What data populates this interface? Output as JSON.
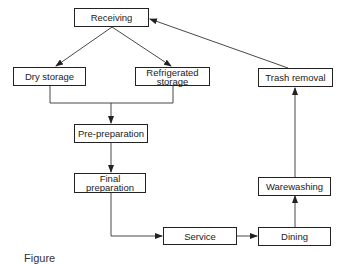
{
  "diagram": {
    "type": "flowchart",
    "nodes": {
      "receiving": "Receiving",
      "dry_storage": "Dry storage",
      "refrigerated_storage_line1": "Refrigerated",
      "refrigerated_storage_line2": "storage",
      "pre_preparation": "Pre-preparation",
      "final_preparation": "Final preparation",
      "service": "Service",
      "dining": "Dining",
      "warewashing": "Warewashing",
      "trash_removal": "Trash removal"
    },
    "edges": [
      {
        "from": "Receiving",
        "to": "Dry storage"
      },
      {
        "from": "Receiving",
        "to": "Refrigerated storage"
      },
      {
        "from": "Dry storage",
        "to": "Pre-preparation"
      },
      {
        "from": "Refrigerated storage",
        "to": "Pre-preparation"
      },
      {
        "from": "Pre-preparation",
        "to": "Final preparation"
      },
      {
        "from": "Final preparation",
        "to": "Service"
      },
      {
        "from": "Service",
        "to": "Dining"
      },
      {
        "from": "Dining",
        "to": "Warewashing"
      },
      {
        "from": "Warewashing",
        "to": "Trash removal"
      },
      {
        "from": "Trash removal",
        "to": "Receiving"
      }
    ],
    "caption": "Figure"
  }
}
